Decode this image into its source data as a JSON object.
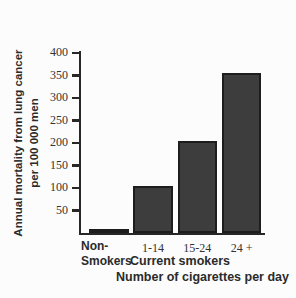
{
  "chart_data": {
    "type": "bar",
    "title": "",
    "categories": [
      "Non-Smokers",
      "1-14",
      "15-24",
      "24 +"
    ],
    "category_display": [
      [
        "Non-",
        "Smokers"
      ],
      [
        "1-14"
      ],
      [
        "15-24"
      ],
      [
        "24 +"
      ]
    ],
    "values": [
      10,
      105,
      205,
      355
    ],
    "ylabel_line1": "Annual mortality from lung cancer",
    "ylabel_line2": "per 100 000 men",
    "group_label": "Current smokers",
    "xlabel": "Number of cigarettes per day",
    "ylim": [
      0,
      400
    ],
    "yticks": [
      400,
      350,
      300,
      250,
      200,
      150,
      100,
      50
    ],
    "grid": false,
    "legend": "none",
    "bar_color": "#3d3d3d",
    "bar_border_color": "#1d1d1d",
    "axis_color": "#272727",
    "label_color": "#2b2b2b",
    "background_color": "#fcfcfc"
  }
}
